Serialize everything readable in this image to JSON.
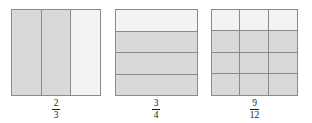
{
  "page": {
    "background_color": "#ffffff"
  },
  "colors": {
    "shaded_fill": "#d9d9d9",
    "unshaded_fill": "#f3f3f3",
    "border": "#8a8a8a",
    "label_text": "#1a1a1a"
  },
  "figures": [
    {
      "id": "figure-two-thirds",
      "layout": "columns",
      "columns": 3,
      "rows": 1,
      "total_parts": 3,
      "shaded_parts": 2,
      "cells": [
        {
          "shaded": true
        },
        {
          "shaded": true
        },
        {
          "shaded": false
        }
      ],
      "label": {
        "numerator": "2",
        "denominator": "3",
        "text": "2/3"
      }
    },
    {
      "id": "figure-three-fourths",
      "layout": "rows",
      "columns": 1,
      "rows": 4,
      "total_parts": 4,
      "shaded_parts": 3,
      "cells": [
        {
          "shaded": false
        },
        {
          "shaded": true
        },
        {
          "shaded": true
        },
        {
          "shaded": true
        }
      ],
      "label": {
        "numerator": "3",
        "denominator": "4",
        "text": "3/4"
      }
    },
    {
      "id": "figure-nine-twelfths",
      "layout": "grid",
      "columns": 3,
      "rows": 4,
      "total_parts": 12,
      "shaded_parts": 9,
      "cells": [
        {
          "shaded": false
        },
        {
          "shaded": false
        },
        {
          "shaded": false
        },
        {
          "shaded": true
        },
        {
          "shaded": true
        },
        {
          "shaded": true
        },
        {
          "shaded": true
        },
        {
          "shaded": true
        },
        {
          "shaded": true
        },
        {
          "shaded": true
        },
        {
          "shaded": true
        },
        {
          "shaded": true
        }
      ],
      "label": {
        "numerator": "9",
        "denominator": "12",
        "text": "9/12"
      }
    }
  ]
}
